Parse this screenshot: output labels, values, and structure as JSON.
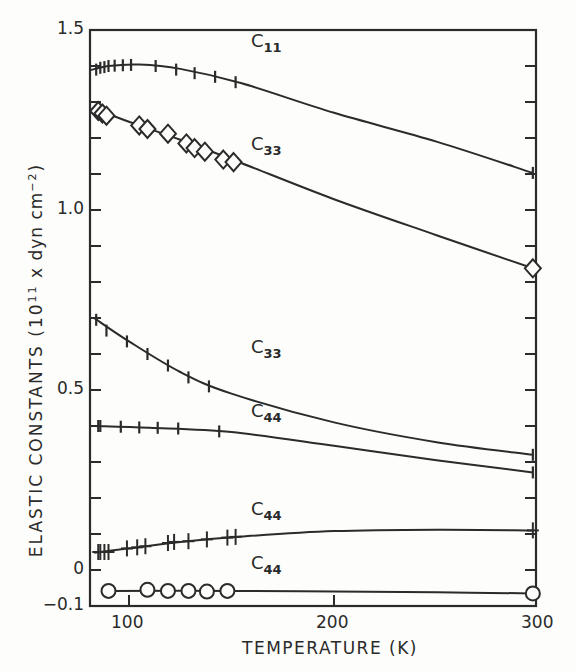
{
  "chart_data": {
    "type": "line",
    "title": "",
    "xlabel": "TEMPERATURE (K)",
    "ylabel": "ELASTIC CONSTANTS (10^11 x dyn cm^-2)",
    "ylabel_parts": {
      "main": "ELASTIC  CONSTANTS  (10",
      "exp1": "11",
      "mid": " x dyn cm",
      "exp2": "−2",
      "end": ")"
    },
    "xlim": [
      81,
      300
    ],
    "ylim": [
      -0.1,
      1.5
    ],
    "xticks": [
      100,
      200,
      300
    ],
    "xtick_labels": [
      "100",
      "200",
      "300"
    ],
    "yticks": [
      -0.1,
      0,
      0.5,
      1.0,
      1.5
    ],
    "ytick_labels": [
      "−0.1",
      "0",
      "0.5",
      "1.0",
      "1.5"
    ],
    "grid": false,
    "legend": "none (curves labeled inline)",
    "series": [
      {
        "name": "C11",
        "label_main": "C",
        "label_sub": "11",
        "label_pos": [
          150,
          1.44
        ],
        "marker": "vbar",
        "points": [
          [
            84,
            1.39
          ],
          [
            86,
            1.395
          ],
          [
            88,
            1.397
          ],
          [
            90,
            1.4
          ],
          [
            93,
            1.401
          ],
          [
            97,
            1.402
          ],
          [
            101,
            1.403
          ],
          [
            113,
            1.4
          ],
          [
            123,
            1.39
          ],
          [
            132,
            1.38
          ],
          [
            142,
            1.37
          ],
          [
            152,
            1.355
          ],
          [
            297,
            1.103
          ]
        ],
        "curve": [
          [
            81,
            1.388
          ],
          [
            90,
            1.4
          ],
          [
            105,
            1.404
          ],
          [
            125,
            1.392
          ],
          [
            155,
            1.352
          ],
          [
            200,
            1.27
          ],
          [
            250,
            1.19
          ],
          [
            297,
            1.103
          ]
        ]
      },
      {
        "name": "C33 (upper)",
        "label_main": "C",
        "label_sub": "33",
        "label_pos": [
          150,
          1.18
        ],
        "marker": "diamond",
        "points": [
          [
            85,
            1.275
          ],
          [
            87,
            1.268
          ],
          [
            89,
            1.262
          ],
          [
            105,
            1.235
          ],
          [
            109,
            1.225
          ],
          [
            119,
            1.212
          ],
          [
            128,
            1.185
          ],
          [
            132,
            1.172
          ],
          [
            137,
            1.162
          ],
          [
            146,
            1.14
          ],
          [
            151,
            1.133
          ],
          [
            297,
            0.838
          ]
        ],
        "curve": [
          [
            84,
            1.28
          ],
          [
            100,
            1.245
          ],
          [
            125,
            1.195
          ],
          [
            155,
            1.13
          ],
          [
            200,
            1.03
          ],
          [
            250,
            0.93
          ],
          [
            297,
            0.838
          ]
        ]
      },
      {
        "name": "C33 (lower)",
        "label_main": "C",
        "label_sub": "33",
        "label_pos": [
          150,
          0.585
        ],
        "marker": "vbar",
        "points": [
          [
            84,
            0.695
          ],
          [
            89,
            0.665
          ],
          [
            99,
            0.635
          ],
          [
            109,
            0.6
          ],
          [
            119,
            0.568
          ],
          [
            129,
            0.535
          ],
          [
            139,
            0.51
          ],
          [
            297,
            0.32
          ]
        ],
        "curve": [
          [
            83,
            0.7
          ],
          [
            100,
            0.635
          ],
          [
            125,
            0.55
          ],
          [
            150,
            0.49
          ],
          [
            200,
            0.41
          ],
          [
            250,
            0.355
          ],
          [
            297,
            0.32
          ]
        ]
      },
      {
        "name": "C44 (upper)",
        "label_main": "C",
        "label_sub": "44",
        "label_pos": [
          150,
          0.41
        ],
        "marker": "vbar",
        "points": [
          [
            85,
            0.4
          ],
          [
            86,
            0.4
          ],
          [
            96,
            0.398
          ],
          [
            105,
            0.396
          ],
          [
            114,
            0.395
          ],
          [
            124,
            0.393
          ],
          [
            144,
            0.385
          ],
          [
            297,
            0.271
          ]
        ],
        "curve": [
          [
            83,
            0.4
          ],
          [
            110,
            0.395
          ],
          [
            150,
            0.383
          ],
          [
            200,
            0.345
          ],
          [
            250,
            0.305
          ],
          [
            297,
            0.271
          ]
        ]
      },
      {
        "name": "C44 (middle)",
        "label_main": "C",
        "label_sub": "44",
        "label_pos": [
          150,
          0.125
        ],
        "marker": "plus",
        "points": [
          [
            85,
            0.05
          ],
          [
            86,
            0.05
          ],
          [
            88,
            0.05
          ],
          [
            90,
            0.05
          ],
          [
            99,
            0.06
          ],
          [
            104,
            0.063
          ],
          [
            108,
            0.066
          ],
          [
            119,
            0.075
          ],
          [
            122,
            0.078
          ],
          [
            129,
            0.08
          ],
          [
            138,
            0.085
          ],
          [
            148,
            0.09
          ],
          [
            152,
            0.092
          ],
          [
            297,
            0.11
          ]
        ],
        "curve": [
          [
            83,
            0.048
          ],
          [
            100,
            0.06
          ],
          [
            125,
            0.078
          ],
          [
            155,
            0.093
          ],
          [
            200,
            0.108
          ],
          [
            250,
            0.112
          ],
          [
            297,
            0.11
          ]
        ]
      },
      {
        "name": "C44 (lowest)",
        "label_main": "C",
        "label_sub": "44",
        "label_pos": [
          150,
          -0.025
        ],
        "marker": "circle",
        "points": [
          [
            90,
            -0.058
          ],
          [
            109,
            -0.055
          ],
          [
            119,
            -0.058
          ],
          [
            129,
            -0.058
          ],
          [
            138,
            -0.06
          ],
          [
            148,
            -0.058
          ],
          [
            297,
            -0.065
          ]
        ],
        "curve": [
          [
            90,
            -0.058
          ],
          [
            150,
            -0.058
          ],
          [
            200,
            -0.06
          ],
          [
            250,
            -0.062
          ],
          [
            297,
            -0.065
          ]
        ]
      }
    ]
  }
}
